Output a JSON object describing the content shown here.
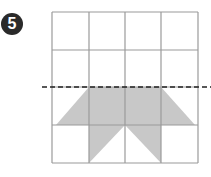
{
  "problem": {
    "number": "5",
    "badge_color": "#2a2a2a"
  },
  "grid": {
    "rows": 4,
    "cols": 4,
    "x": [
      52,
      89,
      125,
      161,
      198
    ],
    "y": [
      12,
      50,
      87,
      125,
      163
    ],
    "line_color": "#9a9a9a"
  },
  "fold_line": {
    "y": 87,
    "x_start": 42,
    "x_end": 211,
    "style": "dashed",
    "color": "#222222"
  },
  "shaded_shape": {
    "fill": "#c8c8c8",
    "polygons": [
      "89,87 161,87 195,125 56,125",
      "89,125 125,125 89,163",
      "125,125 161,125 161,163"
    ]
  }
}
